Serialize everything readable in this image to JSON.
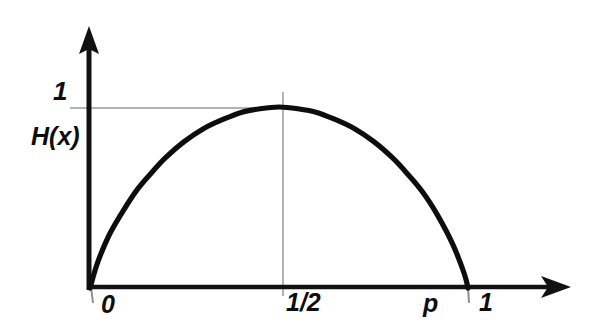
{
  "figure": {
    "background_color": "#ffffff",
    "ink_color": "#0d0d0d",
    "gridline_color": "#9a9a9a",
    "style": "hand-drawn sketch"
  },
  "chart_data": {
    "type": "line",
    "title": "",
    "subtitle": "",
    "xlabel": "",
    "ylabel": "H(x)",
    "grid": true,
    "legend": null,
    "xlim": [
      0,
      1
    ],
    "ylim": [
      0,
      1.08
    ],
    "x_ticks": [
      {
        "value": 0,
        "label": "0"
      },
      {
        "value": 0.5,
        "label": "1/2"
      },
      {
        "value": 0.9,
        "label": "p"
      },
      {
        "value": 1.0,
        "label": "1"
      }
    ],
    "y_ticks": [
      {
        "value": 1,
        "label": "1"
      }
    ],
    "annotations": [
      {
        "text": "H(x)",
        "role": "y-axis-function-label"
      },
      {
        "text": "1",
        "role": "y-axis-max-tick"
      },
      {
        "text": "0",
        "role": "x-axis-origin-tick"
      },
      {
        "text": "1/2",
        "role": "x-axis-midpoint-tick"
      },
      {
        "text": "p",
        "role": "x-axis-variable-tick"
      },
      {
        "text": "1",
        "role": "x-axis-max-tick"
      }
    ],
    "gridlines": [
      {
        "orientation": "horizontal",
        "value": 1,
        "from": 0,
        "to": 0.52
      },
      {
        "orientation": "vertical",
        "value": 0.5,
        "from": 0,
        "to": 1.04
      }
    ],
    "series": [
      {
        "name": "binary entropy H(x)",
        "x": [
          0.0,
          0.02,
          0.05,
          0.08,
          0.12,
          0.16,
          0.2,
          0.25,
          0.3,
          0.35,
          0.4,
          0.45,
          0.5,
          0.55,
          0.6,
          0.65,
          0.7,
          0.75,
          0.8,
          0.84,
          0.88,
          0.92,
          0.96,
          0.99,
          1.0
        ],
        "y": [
          0.0,
          0.14,
          0.29,
          0.4,
          0.53,
          0.63,
          0.72,
          0.81,
          0.88,
          0.93,
          0.97,
          0.99,
          1.0,
          0.99,
          0.97,
          0.93,
          0.88,
          0.81,
          0.72,
          0.63,
          0.53,
          0.4,
          0.24,
          0.08,
          0.0
        ]
      }
    ]
  },
  "axes": {
    "y_axis_name": "vertical-axis",
    "x_axis_name": "horizontal-axis",
    "arrowheads": "both axes terminate in filled arrowheads"
  }
}
